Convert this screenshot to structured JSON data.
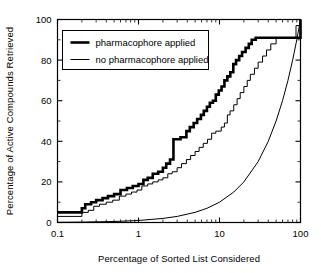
{
  "chart_data": {
    "type": "line",
    "title": "",
    "xlabel": "Percentage of Sorted List Considered",
    "ylabel": "Percentage of Active Compounds Retrieved",
    "xscale": "log",
    "yscale": "linear",
    "xlim": [
      0.1,
      100
    ],
    "ylim": [
      0,
      100
    ],
    "xticks": [
      0.1,
      1,
      10,
      100
    ],
    "xtick_labels": [
      "0.1",
      "1",
      "10",
      "100"
    ],
    "yticks": [
      0,
      20,
      40,
      60,
      80,
      100
    ],
    "ytick_labels": [
      "0",
      "20",
      "40",
      "60",
      "80",
      "100"
    ],
    "yminor_ticks": [
      10,
      30,
      50,
      70,
      90
    ],
    "grid": false,
    "legend_position": "upper left",
    "series": [
      {
        "name": "pharmacophore applied",
        "style": "step",
        "linewidth": 2.6,
        "color": "#000000",
        "points": [
          [
            0.1,
            5
          ],
          [
            0.2,
            5
          ],
          [
            0.2,
            7
          ],
          [
            0.22,
            7
          ],
          [
            0.22,
            9
          ],
          [
            0.26,
            9
          ],
          [
            0.26,
            10
          ],
          [
            0.3,
            10
          ],
          [
            0.3,
            11
          ],
          [
            0.36,
            11
          ],
          [
            0.36,
            12
          ],
          [
            0.42,
            12
          ],
          [
            0.42,
            13
          ],
          [
            0.5,
            13
          ],
          [
            0.5,
            14
          ],
          [
            0.6,
            14
          ],
          [
            0.6,
            16
          ],
          [
            0.72,
            16
          ],
          [
            0.72,
            17
          ],
          [
            0.85,
            17
          ],
          [
            0.85,
            18
          ],
          [
            1.0,
            18
          ],
          [
            1.0,
            19
          ],
          [
            1.15,
            19
          ],
          [
            1.15,
            21
          ],
          [
            1.3,
            21
          ],
          [
            1.3,
            22
          ],
          [
            1.5,
            22
          ],
          [
            1.5,
            24
          ],
          [
            1.75,
            24
          ],
          [
            1.75,
            25
          ],
          [
            2.0,
            25
          ],
          [
            2.0,
            27
          ],
          [
            2.2,
            27
          ],
          [
            2.2,
            29
          ],
          [
            2.45,
            29
          ],
          [
            2.45,
            31
          ],
          [
            2.7,
            31
          ],
          [
            2.7,
            41
          ],
          [
            3.3,
            41
          ],
          [
            3.3,
            42
          ],
          [
            3.9,
            42
          ],
          [
            3.9,
            45
          ],
          [
            4.3,
            45
          ],
          [
            4.3,
            47
          ],
          [
            4.8,
            47
          ],
          [
            4.8,
            49
          ],
          [
            5.3,
            49
          ],
          [
            5.3,
            51
          ],
          [
            5.9,
            51
          ],
          [
            5.9,
            53
          ],
          [
            6.4,
            53
          ],
          [
            6.4,
            55
          ],
          [
            7.0,
            55
          ],
          [
            7.0,
            57
          ],
          [
            7.6,
            57
          ],
          [
            7.6,
            59
          ],
          [
            8.3,
            59
          ],
          [
            8.3,
            60
          ],
          [
            9.0,
            60
          ],
          [
            9.0,
            63
          ],
          [
            9.8,
            63
          ],
          [
            9.8,
            65
          ],
          [
            10.6,
            65
          ],
          [
            10.6,
            67
          ],
          [
            11.5,
            67
          ],
          [
            11.5,
            70
          ],
          [
            12.5,
            70
          ],
          [
            12.5,
            72
          ],
          [
            13.6,
            72
          ],
          [
            13.6,
            74
          ],
          [
            14.8,
            74
          ],
          [
            14.8,
            78
          ],
          [
            16.0,
            78
          ],
          [
            16.0,
            80
          ],
          [
            17.5,
            80
          ],
          [
            17.5,
            82
          ],
          [
            19.0,
            82
          ],
          [
            19.0,
            84
          ],
          [
            21.0,
            84
          ],
          [
            21.0,
            86
          ],
          [
            23.0,
            86
          ],
          [
            23.0,
            88
          ],
          [
            25.0,
            88
          ],
          [
            25.0,
            90
          ],
          [
            28.0,
            90
          ],
          [
            28.0,
            91
          ],
          [
            31.0,
            91
          ],
          [
            100,
            91
          ],
          [
            100,
            100
          ]
        ]
      },
      {
        "name": "no pharmacophore applied",
        "style": "step",
        "linewidth": 1.0,
        "color": "#000000",
        "points": [
          [
            0.1,
            3
          ],
          [
            0.2,
            3
          ],
          [
            0.2,
            5
          ],
          [
            0.24,
            5
          ],
          [
            0.24,
            6
          ],
          [
            0.28,
            6
          ],
          [
            0.28,
            8
          ],
          [
            0.33,
            8
          ],
          [
            0.33,
            9
          ],
          [
            0.4,
            9
          ],
          [
            0.4,
            10
          ],
          [
            0.48,
            10
          ],
          [
            0.48,
            11
          ],
          [
            0.58,
            11
          ],
          [
            0.58,
            13
          ],
          [
            0.7,
            13
          ],
          [
            0.7,
            14
          ],
          [
            0.82,
            14
          ],
          [
            0.82,
            15
          ],
          [
            0.96,
            15
          ],
          [
            0.96,
            16
          ],
          [
            1.1,
            16
          ],
          [
            1.1,
            18
          ],
          [
            1.3,
            18
          ],
          [
            1.3,
            19
          ],
          [
            1.5,
            19
          ],
          [
            1.5,
            20
          ],
          [
            1.75,
            20
          ],
          [
            1.75,
            21
          ],
          [
            2.0,
            21
          ],
          [
            2.0,
            22
          ],
          [
            2.3,
            22
          ],
          [
            2.3,
            24
          ],
          [
            2.6,
            24
          ],
          [
            2.6,
            25
          ],
          [
            3.0,
            25
          ],
          [
            3.0,
            27
          ],
          [
            3.4,
            27
          ],
          [
            3.4,
            29
          ],
          [
            3.9,
            29
          ],
          [
            3.9,
            31
          ],
          [
            4.4,
            31
          ],
          [
            4.4,
            33
          ],
          [
            5.0,
            33
          ],
          [
            5.0,
            35
          ],
          [
            5.6,
            35
          ],
          [
            5.6,
            37
          ],
          [
            6.3,
            37
          ],
          [
            6.3,
            39
          ],
          [
            7.1,
            39
          ],
          [
            7.1,
            41
          ],
          [
            8.0,
            41
          ],
          [
            8.0,
            44
          ],
          [
            9.0,
            44
          ],
          [
            9.0,
            45
          ],
          [
            10.5,
            45
          ],
          [
            10.5,
            47
          ],
          [
            11.5,
            47
          ],
          [
            11.5,
            49
          ],
          [
            12.5,
            49
          ],
          [
            12.5,
            53
          ],
          [
            13.5,
            53
          ],
          [
            13.5,
            55
          ],
          [
            15.0,
            55
          ],
          [
            15.0,
            58
          ],
          [
            16.5,
            58
          ],
          [
            16.5,
            61
          ],
          [
            18.0,
            61
          ],
          [
            18.0,
            64
          ],
          [
            20.0,
            64
          ],
          [
            20.0,
            67
          ],
          [
            22.0,
            67
          ],
          [
            22.0,
            70
          ],
          [
            24.0,
            70
          ],
          [
            24.0,
            73
          ],
          [
            27.0,
            73
          ],
          [
            27.0,
            76
          ],
          [
            30.0,
            76
          ],
          [
            30.0,
            79
          ],
          [
            34.0,
            79
          ],
          [
            34.0,
            82
          ],
          [
            38.0,
            82
          ],
          [
            38.0,
            85
          ],
          [
            43.0,
            85
          ],
          [
            43.0,
            88
          ],
          [
            50.0,
            88
          ],
          [
            50.0,
            91
          ],
          [
            88.0,
            91
          ],
          [
            88.0,
            97
          ],
          [
            100,
            97
          ],
          [
            100,
            100
          ]
        ]
      },
      {
        "name": "random baseline",
        "style": "smooth",
        "linewidth": 1.0,
        "color": "#000000",
        "points": [
          [
            0.1,
            0.1
          ],
          [
            0.2,
            0.2
          ],
          [
            0.5,
            0.5
          ],
          [
            1,
            1
          ],
          [
            2,
            2
          ],
          [
            3,
            3
          ],
          [
            5,
            5
          ],
          [
            7,
            7
          ],
          [
            10,
            10
          ],
          [
            15,
            15
          ],
          [
            20,
            20
          ],
          [
            30,
            30
          ],
          [
            40,
            40
          ],
          [
            50,
            50
          ],
          [
            60,
            60
          ],
          [
            70,
            70
          ],
          [
            80,
            80
          ],
          [
            90,
            90
          ],
          [
            100,
            100
          ]
        ]
      }
    ],
    "legend_entries": [
      {
        "label": "pharmacophore applied",
        "linewidth": 2.6,
        "color": "#000000"
      },
      {
        "label": "no pharmacophore applied",
        "linewidth": 1.0,
        "color": "#000000"
      }
    ]
  },
  "colors": {
    "axis": "#000000",
    "background": "#ffffff",
    "series_primary": "#000000",
    "series_secondary": "#000000"
  }
}
